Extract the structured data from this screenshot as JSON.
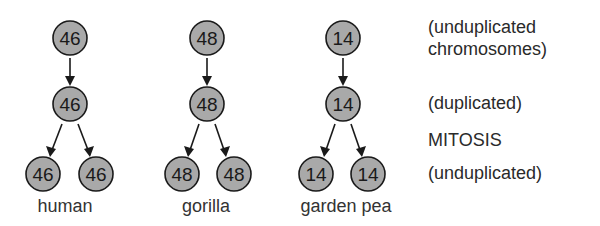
{
  "diagram": {
    "type": "chromosome-count-mitosis",
    "species": [
      {
        "name": "human",
        "top": "46",
        "middle": "46",
        "bottom_left": "46",
        "bottom_right": "46"
      },
      {
        "name": "gorilla",
        "top": "48",
        "middle": "48",
        "bottom_left": "48",
        "bottom_right": "48"
      },
      {
        "name": "garden pea",
        "top": "14",
        "middle": "14",
        "bottom_left": "14",
        "bottom_right": "14"
      }
    ],
    "labels": {
      "row1_line1": "(unduplicated",
      "row1_line2": "chromosomes)",
      "row2": "(duplicated)",
      "process": "MITOSIS",
      "row3": "(unduplicated)"
    },
    "colors": {
      "circle_fill": "#a9a9a9",
      "stroke": "#1a1a1a"
    }
  }
}
